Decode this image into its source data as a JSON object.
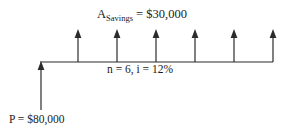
{
  "diagram": {
    "type": "cash-flow-diagram",
    "background_color": "#ffffff",
    "line_color": "#2b2b2b",
    "labels": {
      "annuity_symbol": "A",
      "annuity_subscript": "Savings",
      "annuity_equals": " = $30,000",
      "annuity_full": "A_Savings = $30,000",
      "period_interest": "n = 6, i = 12%",
      "principal": "P = $80,000"
    },
    "values": {
      "annuity_amount": "$30,000",
      "principal_amount": "$80,000",
      "periods": "6",
      "interest_rate": "12%"
    },
    "timeline": {
      "baseline_y": 62,
      "x_start": 40,
      "x_end": 273
    },
    "inflow_arrows": {
      "count": 6,
      "direction": "up",
      "x_positions": [
        78,
        117,
        156,
        195,
        234,
        273
      ],
      "top_y": 31,
      "base_y": 62
    },
    "outflow_arrow": {
      "count": 1,
      "direction": "up",
      "x_position": 41,
      "top_y": 62,
      "bottom_y": 110
    }
  }
}
